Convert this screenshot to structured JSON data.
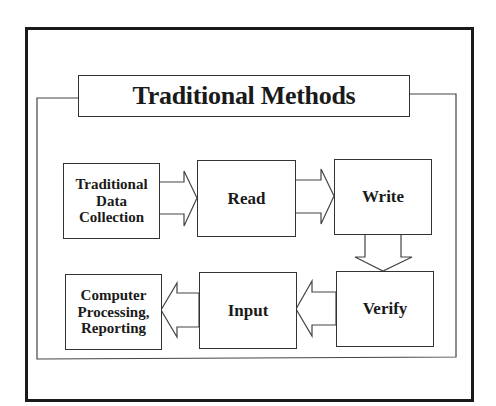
{
  "title": "Traditional Methods",
  "nodes": [
    {
      "id": "traditional-data-collection",
      "label": "Traditional\nData\nCollection"
    },
    {
      "id": "read",
      "label": "Read"
    },
    {
      "id": "write",
      "label": "Write"
    },
    {
      "id": "verify",
      "label": "Verify"
    },
    {
      "id": "input",
      "label": "Input"
    },
    {
      "id": "computer-processing",
      "label": "Computer\nProcessing,\nReporting"
    }
  ],
  "edges": [
    {
      "from": "traditional-data-collection",
      "to": "read",
      "direction": "right"
    },
    {
      "from": "read",
      "to": "write",
      "direction": "right"
    },
    {
      "from": "write",
      "to": "verify",
      "direction": "down"
    },
    {
      "from": "verify",
      "to": "input",
      "direction": "left"
    },
    {
      "from": "input",
      "to": "computer-processing",
      "direction": "left"
    }
  ],
  "colors": {
    "line": "#333333",
    "frame": "#1a1a1a",
    "background": "#ffffff"
  }
}
